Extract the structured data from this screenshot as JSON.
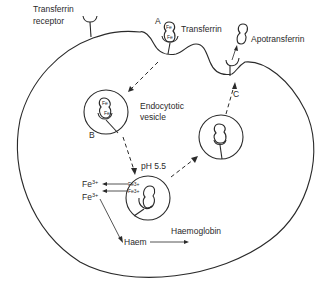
{
  "diagram": {
    "labels": {
      "transferrin_receptor_line1": "Transferrin",
      "transferrin_receptor_line2": "receptor",
      "transferrin": "Transferrin",
      "apotransferrin": "Apotransferrin",
      "endocytotic_vesicle_line1": "Endocytotic",
      "endocytotic_vesicle_line2": "vesicle",
      "ph": "pH 5.5",
      "fe3_a": "Fe",
      "fe3_b": "Fe",
      "fe_sup": "3+",
      "haem": "Haem",
      "haemoglobin": "Haemoglobin",
      "fe_inner": "Fe",
      "fe3_inner_a": "Fe3+",
      "fe3_inner_b": "Fe3+"
    },
    "step_markers": {
      "a": "A",
      "b": "B",
      "c": "C"
    },
    "colors": {
      "line": "#2a2a2a",
      "background": "#ffffff"
    }
  }
}
